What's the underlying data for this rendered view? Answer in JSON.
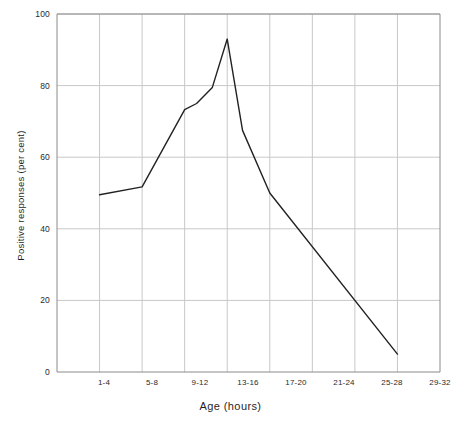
{
  "chart_data": {
    "type": "line",
    "title": "",
    "xlabel": "Age  (hours)",
    "ylabel": "Positive responses  (per cent)",
    "categories": [
      "1-4",
      "5-8",
      "9-12",
      "13-16",
      "17-20",
      "21-24",
      "25-28",
      "29-32"
    ],
    "xlim": [
      0,
      9
    ],
    "ylim": [
      0,
      100
    ],
    "yticks": [
      0,
      20,
      40,
      60,
      80,
      100
    ],
    "grid": true,
    "legend": "none",
    "line_color": "#222222",
    "grid_color": "#c8c8c8",
    "series": [
      {
        "name": "Positive responses",
        "values": [
          49.5,
          51.7,
          74.0,
          93.0,
          50.0,
          35.5,
          21.0,
          5.0
        ]
      }
    ],
    "vertices": [
      {
        "x": 1.0,
        "y": 49.5
      },
      {
        "x": 2.0,
        "y": 51.7
      },
      {
        "x": 3.0,
        "y": 73.3
      },
      {
        "x": 3.28,
        "y": 75.0
      },
      {
        "x": 3.65,
        "y": 79.5
      },
      {
        "x": 4.0,
        "y": 93.0
      },
      {
        "x": 4.36,
        "y": 67.5
      },
      {
        "x": 5.0,
        "y": 50.0
      },
      {
        "x": 8.0,
        "y": 5.0
      }
    ],
    "annotations": {
      "peak_value": 93,
      "peak_category": "13-16",
      "start_value": 49.5,
      "end_value": 5
    }
  },
  "ytick_labels": [
    "100",
    "80",
    "60",
    "40",
    "20",
    "0"
  ],
  "xtick_labels": [
    "1-4",
    "5-8",
    "9-12",
    "13-16",
    "17-20",
    "21-24",
    "25-28",
    "29-32"
  ],
  "axis_titles": {
    "x": "Age  (hours)",
    "y": "Positive responses  (per cent)"
  }
}
